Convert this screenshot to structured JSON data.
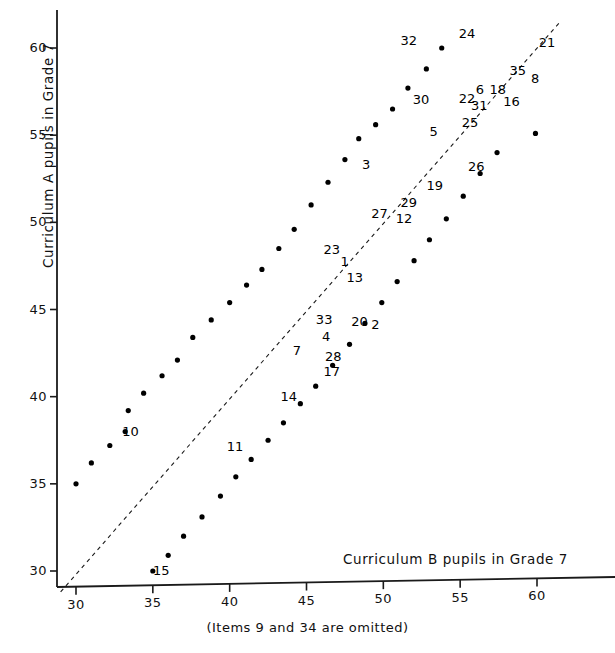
{
  "chart_data": {
    "type": "scatter",
    "title": "",
    "xlabel": "Curriculum B pupils in Grade 7",
    "ylabel": "Curriculum A pupils in Grade 7",
    "caption": "(Items  9 and 34  are omitted)",
    "xlim": [
      29,
      62
    ],
    "ylim": [
      28.8,
      61.8
    ],
    "xticks": [
      30,
      35,
      40,
      45,
      50,
      55,
      60
    ],
    "yticks": [
      30,
      35,
      40,
      45,
      50,
      55,
      60
    ],
    "grid": false,
    "legend": null,
    "reference_line": {
      "kind": "identity",
      "style": "dashed",
      "from": [
        29,
        28.8
      ],
      "to": [
        61.5,
        61.5
      ]
    },
    "points": [
      {
        "label": "10",
        "x": 33.2,
        "y": 38.0,
        "lx": 8,
        "ly": -2
      },
      {
        "label": "",
        "x": 30.0,
        "y": 35.0,
        "lx": 0,
        "ly": 0
      },
      {
        "label": "",
        "x": 31.0,
        "y": 36.2,
        "lx": 0,
        "ly": 0
      },
      {
        "label": "",
        "x": 32.2,
        "y": 37.2,
        "lx": 0,
        "ly": 0
      },
      {
        "label": "",
        "x": 33.4,
        "y": 39.2,
        "lx": 0,
        "ly": 0
      },
      {
        "label": "",
        "x": 34.4,
        "y": 40.2,
        "lx": 0,
        "ly": 0
      },
      {
        "label": "",
        "x": 35.6,
        "y": 41.2,
        "lx": 0,
        "ly": 0
      },
      {
        "label": "",
        "x": 36.6,
        "y": 42.1,
        "lx": 0,
        "ly": 0
      },
      {
        "label": "",
        "x": 37.6,
        "y": 43.4,
        "lx": 0,
        "ly": 0
      },
      {
        "label": "",
        "x": 38.8,
        "y": 44.4,
        "lx": 0,
        "ly": 0
      },
      {
        "label": "",
        "x": 40.0,
        "y": 45.4,
        "lx": 0,
        "ly": 0
      },
      {
        "label": "",
        "x": 41.1,
        "y": 46.4,
        "lx": 0,
        "ly": 0
      },
      {
        "label": "",
        "x": 42.1,
        "y": 47.3,
        "lx": 0,
        "ly": 0
      },
      {
        "label": "",
        "x": 43.2,
        "y": 48.5,
        "lx": 0,
        "ly": 0
      },
      {
        "label": "",
        "x": 44.2,
        "y": 49.6,
        "lx": 0,
        "ly": 0
      },
      {
        "label": "",
        "x": 45.3,
        "y": 51.0,
        "lx": 0,
        "ly": 0
      },
      {
        "label": "",
        "x": 46.4,
        "y": 52.3,
        "lx": 0,
        "ly": 0
      },
      {
        "label": "",
        "x": 47.5,
        "y": 53.6,
        "lx": 0,
        "ly": 0
      },
      {
        "label": "",
        "x": 48.4,
        "y": 54.8,
        "lx": 0,
        "ly": 0
      },
      {
        "label": "",
        "x": 49.5,
        "y": 55.6,
        "lx": 0,
        "ly": 0
      },
      {
        "label": "",
        "x": 50.6,
        "y": 56.5,
        "lx": 0,
        "ly": 0
      },
      {
        "label": "",
        "x": 51.6,
        "y": 57.7,
        "lx": 0,
        "ly": 0
      },
      {
        "label": "",
        "x": 52.8,
        "y": 58.8,
        "lx": 0,
        "ly": 0
      },
      {
        "label": "",
        "x": 53.8,
        "y": 60.0,
        "lx": 0,
        "ly": 0
      },
      {
        "label": "15",
        "x": 35.0,
        "y": 30.0,
        "lx": 6,
        "ly": -2
      },
      {
        "label": "",
        "x": 36.0,
        "y": 30.9,
        "lx": 0,
        "ly": 0
      },
      {
        "label": "",
        "x": 37.0,
        "y": 32.0,
        "lx": 0,
        "ly": 0
      },
      {
        "label": "",
        "x": 38.2,
        "y": 33.1,
        "lx": 0,
        "ly": 0
      },
      {
        "label": "",
        "x": 39.4,
        "y": 34.3,
        "lx": 0,
        "ly": 0
      },
      {
        "label": "",
        "x": 40.4,
        "y": 35.4,
        "lx": 0,
        "ly": 0
      },
      {
        "label": "",
        "x": 41.4,
        "y": 36.4,
        "lx": 0,
        "ly": 0
      },
      {
        "label": "",
        "x": 42.5,
        "y": 37.5,
        "lx": 0,
        "ly": 0
      },
      {
        "label": "",
        "x": 43.5,
        "y": 38.5,
        "lx": 0,
        "ly": 0
      },
      {
        "label": "",
        "x": 44.6,
        "y": 39.6,
        "lx": 0,
        "ly": 0
      },
      {
        "label": "",
        "x": 45.6,
        "y": 40.6,
        "lx": 0,
        "ly": 0
      },
      {
        "label": "",
        "x": 46.7,
        "y": 41.8,
        "lx": 0,
        "ly": 0
      },
      {
        "label": "",
        "x": 47.8,
        "y": 43.0,
        "lx": 0,
        "ly": 0
      },
      {
        "label": "",
        "x": 48.8,
        "y": 44.2,
        "lx": 0,
        "ly": 0
      },
      {
        "label": "",
        "x": 49.9,
        "y": 45.4,
        "lx": 0,
        "ly": 0
      },
      {
        "label": "",
        "x": 50.9,
        "y": 46.6,
        "lx": 0,
        "ly": 0
      },
      {
        "label": "",
        "x": 52.0,
        "y": 47.8,
        "lx": 0,
        "ly": 0
      },
      {
        "label": "",
        "x": 53.0,
        "y": 49.0,
        "lx": 0,
        "ly": 0
      },
      {
        "label": "",
        "x": 54.1,
        "y": 50.2,
        "lx": 0,
        "ly": 0
      },
      {
        "label": "",
        "x": 55.2,
        "y": 51.5,
        "lx": 0,
        "ly": 0
      },
      {
        "label": "",
        "x": 56.3,
        "y": 52.8,
        "lx": 0,
        "ly": 0
      },
      {
        "label": "",
        "x": 57.4,
        "y": 54.0,
        "lx": 0,
        "ly": 0
      },
      {
        "label": "",
        "x": 59.9,
        "y": 55.1,
        "lx": 0,
        "ly": 0
      }
    ],
    "annotations": [
      {
        "label": "32",
        "x": 51.5,
        "y": 60.4
      },
      {
        "label": "24",
        "x": 55.3,
        "y": 60.8
      },
      {
        "label": "21",
        "x": 60.5,
        "y": 60.3
      },
      {
        "label": "35",
        "x": 58.6,
        "y": 58.7
      },
      {
        "label": "8",
        "x": 60.0,
        "y": 58.2
      },
      {
        "label": "6",
        "x": 56.4,
        "y": 57.6
      },
      {
        "label": "18",
        "x": 57.3,
        "y": 57.6
      },
      {
        "label": "16",
        "x": 58.2,
        "y": 56.9
      },
      {
        "label": "22",
        "x": 55.3,
        "y": 57.1
      },
      {
        "label": "31",
        "x": 56.1,
        "y": 56.7
      },
      {
        "label": "30",
        "x": 52.3,
        "y": 57.0
      },
      {
        "label": "25",
        "x": 55.5,
        "y": 55.7
      },
      {
        "label": "5",
        "x": 53.4,
        "y": 55.2
      },
      {
        "label": "26",
        "x": 55.9,
        "y": 53.2
      },
      {
        "label": "3",
        "x": 49.0,
        "y": 53.3
      },
      {
        "label": "19",
        "x": 53.2,
        "y": 52.1
      },
      {
        "label": "29",
        "x": 51.5,
        "y": 51.1
      },
      {
        "label": "27",
        "x": 49.6,
        "y": 50.5
      },
      {
        "label": "12",
        "x": 51.2,
        "y": 50.2
      },
      {
        "label": "23",
        "x": 46.5,
        "y": 48.4
      },
      {
        "label": "1",
        "x": 47.6,
        "y": 47.7
      },
      {
        "label": "13",
        "x": 48.0,
        "y": 46.8
      },
      {
        "label": "33",
        "x": 46.0,
        "y": 44.4
      },
      {
        "label": "20",
        "x": 48.3,
        "y": 44.3
      },
      {
        "label": "2",
        "x": 49.6,
        "y": 44.1
      },
      {
        "label": "4",
        "x": 46.4,
        "y": 43.4
      },
      {
        "label": "7",
        "x": 44.5,
        "y": 42.6
      },
      {
        "label": "28",
        "x": 46.6,
        "y": 42.3
      },
      {
        "label": "17",
        "x": 46.5,
        "y": 41.4
      },
      {
        "label": "14",
        "x": 43.7,
        "y": 40.0
      },
      {
        "label": "11",
        "x": 40.2,
        "y": 37.1
      },
      {
        "label": "10",
        "x": 33.4,
        "y": 38.0
      },
      {
        "label": "15",
        "x": 35.4,
        "y": 30.0
      }
    ]
  }
}
